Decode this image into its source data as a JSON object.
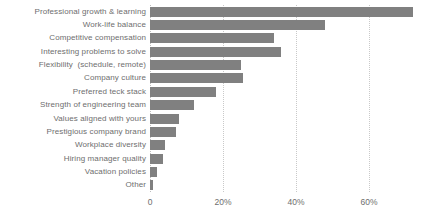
{
  "chart_data": {
    "type": "bar",
    "orientation": "horizontal",
    "title": "",
    "xlabel": "",
    "ylabel": "",
    "xlim": [
      0,
      72.6
    ],
    "grid": true,
    "legend": null,
    "bar_color": "#808080",
    "categories": [
      "Professional growth & learning",
      "Work-life balance",
      "Competitive compensation",
      "Interesting problems to solve",
      "Flexibility  (schedule, remote)",
      "Company culture",
      "Preferred teck stack",
      "Strength of engineering team",
      "Values aligned with yours",
      "Prestigious company brand",
      "Workplace diversity",
      "Hiring manager quality",
      "Vacation policies",
      "Other"
    ],
    "values": [
      72,
      48,
      34,
      36,
      25,
      25.5,
      18,
      12,
      8,
      7,
      4,
      3.5,
      2,
      0.7
    ],
    "xticks": [
      0,
      20,
      40,
      60
    ],
    "xticklabels": [
      "0",
      "20%",
      "40%",
      "60%"
    ]
  }
}
